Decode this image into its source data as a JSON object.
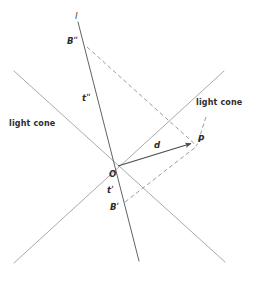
{
  "figure": {
    "kind": "minkowski-spacetime-diagram",
    "width": 257,
    "height": 284,
    "background_color": "#ffffff",
    "stroke_color_solid": "#4a4a4a",
    "stroke_color_light": "#9a9a9a",
    "stroke_color_dashed": "#8a8a8a",
    "label_color": "#2b2b2b"
  },
  "labels": {
    "line_l": "l",
    "point_b_future": "Bʺ",
    "point_b_past": "Bʹ",
    "axis_t_future": "tʺ",
    "axis_t_past": "tʹ",
    "origin": "O",
    "point_p": "P",
    "distance_d": "d",
    "light_cone_left": "light cone",
    "light_cone_right": "light cone"
  },
  "geometry": {
    "origin": {
      "x": 118,
      "y": 166
    },
    "point_p": {
      "x": 193,
      "y": 143
    },
    "point_b_future": {
      "x": 87,
      "y": 47
    },
    "point_b_past": {
      "x": 125,
      "y": 202
    },
    "line_l": {
      "x1": 78,
      "y1": 22,
      "x2": 139,
      "y2": 261
    },
    "light_cone_ne_sw": {
      "x1": 224,
      "y1": 71,
      "x2": 14,
      "y2": 263
    },
    "light_cone_nw_se": {
      "x1": 14,
      "y1": 71,
      "x2": 225,
      "y2": 262
    },
    "dashed_bfuture_to_p": {
      "x1": 87,
      "y1": 47,
      "x2": 196,
      "y2": 145
    },
    "dashed_bpast_to_p": {
      "x1": 125,
      "y1": 202,
      "x2": 196,
      "y2": 145
    },
    "dashed_vertical": {
      "x1": 206,
      "y1": 117,
      "x2": 196,
      "y2": 145
    }
  },
  "label_positions": {
    "line_l": {
      "x": 75,
      "y": 14
    },
    "point_b_future": {
      "x": 68,
      "y": 37
    },
    "point_b_past": {
      "x": 111,
      "y": 204
    },
    "axis_t_future": {
      "x": 83,
      "y": 96
    },
    "axis_t_past": {
      "x": 108,
      "y": 187
    },
    "origin": {
      "x": 110,
      "y": 172
    },
    "point_p": {
      "x": 199,
      "y": 136
    },
    "distance_d": {
      "x": 155,
      "y": 144
    },
    "light_cone_left": {
      "x": 10,
      "y": 122
    },
    "light_cone_right": {
      "x": 196,
      "y": 101
    }
  }
}
